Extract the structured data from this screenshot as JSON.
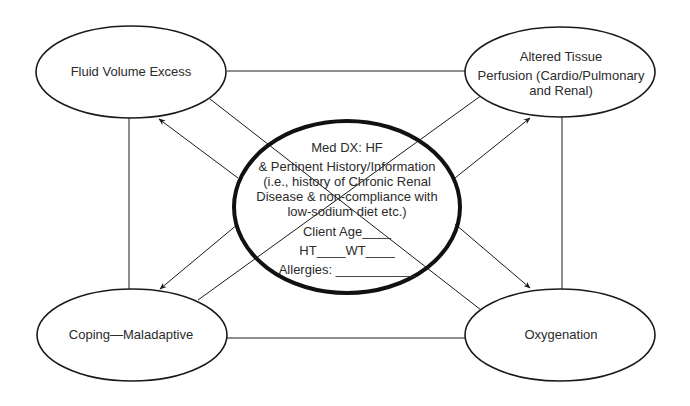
{
  "diagram": {
    "type": "concept-map",
    "center": {
      "title": "Med DX: HF",
      "lines": [
        "& Pertinent History/Information",
        "(i.e., history of Chronic Renal",
        "Disease & non-compliance with",
        "low-sodium diet etc.)"
      ],
      "fields": {
        "client_age": "Client Age____",
        "ht_wt": "HT____WT____",
        "allergies": "Allergies: ___________"
      }
    },
    "nodes": {
      "top_left": {
        "label": "Fluid Volume Excess"
      },
      "top_right": {
        "lines": [
          "Altered Tissue",
          "Perfusion (Cardio/Pulmonary",
          "and Renal)"
        ]
      },
      "bottom_left": {
        "label": "Coping—Maladaptive"
      },
      "bottom_right": {
        "label": "Oxygenation"
      }
    },
    "colors": {
      "stroke": "#1a1a1a",
      "text": "#2b2b2b",
      "background": "#ffffff"
    }
  }
}
